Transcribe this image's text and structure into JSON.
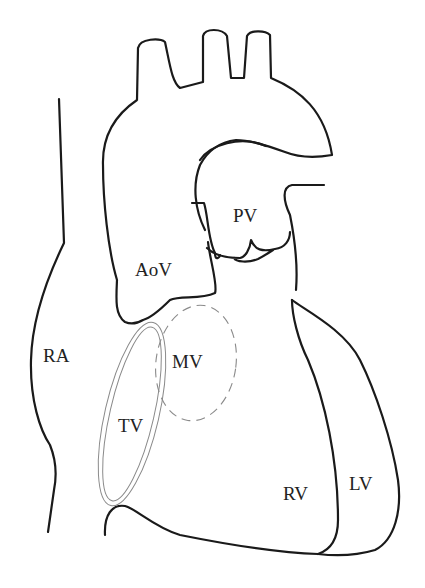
{
  "diagram": {
    "type": "anatomical line drawing",
    "labels": {
      "ra": "RA",
      "aov": "AoV",
      "pv": "PV",
      "mv": "MV",
      "tv": "TV",
      "rv": "RV",
      "lv": "LV"
    },
    "colors": {
      "outline": "#1a1a1a",
      "valve_outline": "#8a8a8a",
      "label_text": "#222222",
      "background": "#ffffff"
    }
  }
}
